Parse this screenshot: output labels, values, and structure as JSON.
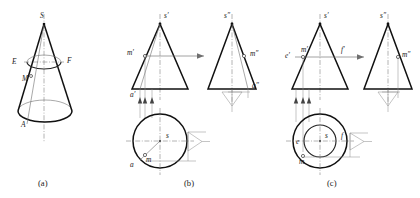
{
  "figure": {
    "captions": [
      {
        "id": "cap-a",
        "text": "(a)",
        "x": 44,
        "y": 186
      },
      {
        "id": "cap-b",
        "text": "(b)",
        "x": 190,
        "y": 186
      },
      {
        "id": "cap-c",
        "text": "(c)",
        "x": 333,
        "y": 186
      }
    ],
    "colors": {
      "outline": "#111111",
      "construction": "#6f6f6f",
      "centerline": "#777777",
      "background": "#ffffff"
    }
  },
  "panel_a": {
    "name": "pictorial-cone",
    "labels": [
      {
        "id": "a-apex",
        "text": "S",
        "x": 40,
        "y": 18
      },
      {
        "id": "a-left",
        "text": "E",
        "x": 12,
        "y": 64
      },
      {
        "id": "a-right",
        "text": "F",
        "x": 67,
        "y": 63
      },
      {
        "id": "a-point",
        "text": "M",
        "x": 22,
        "y": 81
      },
      {
        "id": "a-base",
        "text": "A",
        "x": 21,
        "y": 127
      }
    ]
  },
  "panel_b": {
    "name": "cone-point-on-generatrix",
    "front_view": {
      "labels": [
        {
          "id": "b-f-s",
          "text": "s′",
          "x": 160,
          "y": 16
        },
        {
          "id": "b-f-m",
          "text": "m′",
          "x": 124,
          "y": 54
        },
        {
          "id": "b-f-a",
          "text": "a′",
          "x": 127,
          "y": 90
        }
      ]
    },
    "side_view": {
      "labels": [
        {
          "id": "b-s-s",
          "text": "s″",
          "x": 222,
          "y": 16
        },
        {
          "id": "b-s-m",
          "text": "m″",
          "x": 253,
          "y": 54
        },
        {
          "id": "b-s-a",
          "text": "a″",
          "x": 252,
          "y": 88
        }
      ]
    },
    "top_view": {
      "labels": [
        {
          "id": "b-t-s",
          "text": "s",
          "x": 166,
          "y": 137
        },
        {
          "id": "b-t-a",
          "text": "a",
          "x": 128,
          "y": 162
        },
        {
          "id": "b-t-m",
          "text": "m",
          "x": 141,
          "y": 157
        }
      ]
    }
  },
  "panel_c": {
    "name": "cone-point-via-auxiliary-circle",
    "front_view": {
      "labels": [
        {
          "id": "c-f-s",
          "text": "s′",
          "x": 323,
          "y": 16
        },
        {
          "id": "c-f-e",
          "text": "e′",
          "x": 284,
          "y": 55
        },
        {
          "id": "c-f-m",
          "text": "m′",
          "x": 300,
          "y": 51
        },
        {
          "id": "c-f-f",
          "text": "f′",
          "x": 341,
          "y": 50
        }
      ]
    },
    "side_view": {
      "labels": [
        {
          "id": "c-s-s",
          "text": "s″",
          "x": 382,
          "y": 16
        },
        {
          "id": "c-s-m",
          "text": "m″",
          "x": 402,
          "y": 55
        }
      ]
    },
    "top_view": {
      "labels": [
        {
          "id": "c-t-e",
          "text": "e",
          "x": 297,
          "y": 143
        },
        {
          "id": "c-t-s",
          "text": "s",
          "x": 326,
          "y": 143
        },
        {
          "id": "c-t-f",
          "text": "f",
          "x": 349,
          "y": 142
        },
        {
          "id": "c-t-m",
          "text": "m",
          "x": 310,
          "y": 167
        }
      ]
    }
  }
}
